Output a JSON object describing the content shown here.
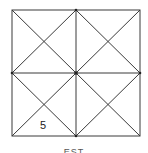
{
  "diagram": {
    "type": "square-grid-with-diagonals",
    "square": {
      "x": 12,
      "y": 10,
      "size": 128
    },
    "stroke_color": "#333333",
    "label": {
      "text": "5",
      "x": 44,
      "y": 128
    },
    "caption": "EST"
  }
}
